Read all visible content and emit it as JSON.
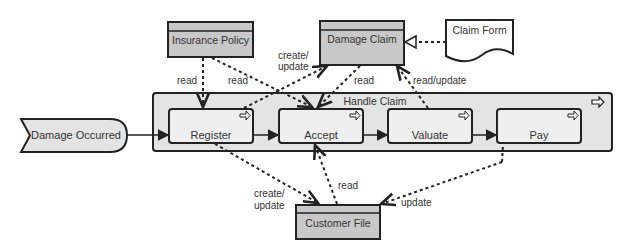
{
  "diagram": {
    "type": "ArchiMate business process diagram",
    "colors": {
      "object_fill": "#c8c8c8",
      "process_fill": "#efefef",
      "group_fill": "#e4e4e4",
      "stroke": "#222222",
      "text": "#333333"
    },
    "event": {
      "label": "Damage Occurred"
    },
    "group_process": {
      "label": "Handle Claim"
    },
    "processes": [
      {
        "label": "Register"
      },
      {
        "label": "Accept"
      },
      {
        "label": "Valuate"
      },
      {
        "label": "Pay"
      }
    ],
    "objects": {
      "insurance_policy": {
        "label": "Insurance Policy"
      },
      "damage_claim": {
        "label": "Damage Claim"
      },
      "customer_file": {
        "label": "Customer File"
      }
    },
    "representation": {
      "label": "Claim Form"
    },
    "relation_labels": {
      "policy_register": "read",
      "policy_accept": "read",
      "register_claim_l1": "create/",
      "register_claim_l2": "update",
      "claim_accept": "read",
      "claim_valuate": "read/update",
      "register_file_l1": "create/",
      "register_file_l2": "update",
      "accept_file": "read",
      "pay_file": "update"
    }
  }
}
